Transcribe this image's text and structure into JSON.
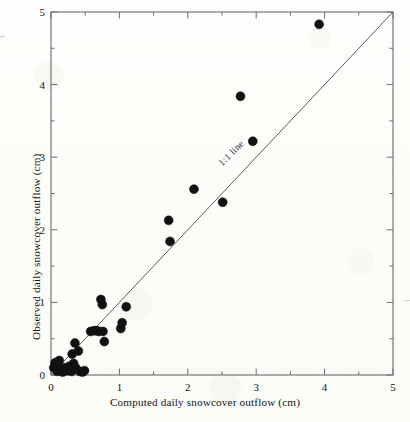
{
  "figure": {
    "background_color": "#fdfdfa",
    "frame_color": "#6d6f72",
    "marker_color": "#111111",
    "line_color": "#5b5d60",
    "text_color": "#15171a"
  },
  "chart_data": {
    "type": "scatter",
    "title": "",
    "subtitle": "",
    "xlabel": "Computed daily snowcover outflow (cm)",
    "ylabel": "Observed daily snowcover outflow (cm)",
    "xlim": [
      0,
      5
    ],
    "ylim": [
      0,
      5
    ],
    "xticks": [
      0,
      1,
      2,
      3,
      4,
      5
    ],
    "yticks": [
      0,
      1,
      2,
      3,
      4,
      5
    ],
    "xtick_labels": [
      "0",
      "1",
      "2",
      "3",
      "4",
      "5"
    ],
    "ytick_labels": [
      "0",
      "1",
      "2",
      "3",
      "4",
      "5"
    ],
    "minor_tick_step": 0.5,
    "grid": false,
    "legend": null,
    "legend_position": "none",
    "annotations": [
      {
        "text": "1:1 line",
        "x": 2.85,
        "y": 2.85,
        "rotation_deg": -45,
        "name": "one-to-one-line-label"
      }
    ],
    "reference_lines": [
      {
        "name": "one-to-one-line",
        "type": "identity",
        "from": [
          0,
          0
        ],
        "to": [
          5,
          5
        ]
      }
    ],
    "marker": {
      "shape": "circle",
      "size_px": 9,
      "color": "#111111",
      "edge_color": "#111111"
    },
    "series": [
      {
        "name": "Daily snowcover outflow",
        "points": [
          [
            0.04,
            0.1
          ],
          [
            0.06,
            0.17
          ],
          [
            0.08,
            0.13
          ],
          [
            0.09,
            0.05
          ],
          [
            0.12,
            0.2
          ],
          [
            0.14,
            0.08
          ],
          [
            0.17,
            0.04
          ],
          [
            0.2,
            0.1
          ],
          [
            0.24,
            0.06
          ],
          [
            0.27,
            0.12
          ],
          [
            0.3,
            0.05
          ],
          [
            0.31,
            0.29
          ],
          [
            0.33,
            0.16
          ],
          [
            0.35,
            0.44
          ],
          [
            0.36,
            0.1
          ],
          [
            0.4,
            0.33
          ],
          [
            0.42,
            0.05
          ],
          [
            0.46,
            0.04
          ],
          [
            0.49,
            0.06
          ],
          [
            0.58,
            0.6
          ],
          [
            0.63,
            0.61
          ],
          [
            0.67,
            0.61
          ],
          [
            0.7,
            0.6
          ],
          [
            0.73,
            1.04
          ],
          [
            0.75,
            0.97
          ],
          [
            0.76,
            0.6
          ],
          [
            0.78,
            0.46
          ],
          [
            1.02,
            0.64
          ],
          [
            1.04,
            0.72
          ],
          [
            1.1,
            0.94
          ],
          [
            1.72,
            2.13
          ],
          [
            1.74,
            1.84
          ],
          [
            2.09,
            2.56
          ],
          [
            2.51,
            2.38
          ],
          [
            2.77,
            3.84
          ],
          [
            2.95,
            3.22
          ],
          [
            3.92,
            4.83
          ]
        ]
      }
    ]
  }
}
